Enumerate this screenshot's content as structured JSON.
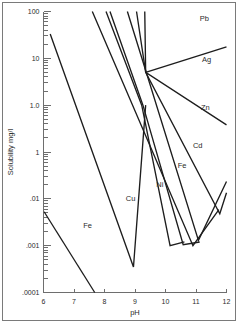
{
  "chart_data": {
    "type": "line",
    "title": "",
    "xlabel": "pH",
    "ylabel": "Solubility mg/l",
    "xlim": [
      6,
      12
    ],
    "ylim": [
      0.0001,
      100
    ],
    "yscale": "log",
    "grid": false,
    "legend_position": "inline-labels",
    "x_ticks": [
      "6",
      "7",
      "8",
      "9",
      "10",
      "11",
      "12"
    ],
    "x_tick_values": [
      6,
      7,
      8,
      9,
      10,
      11,
      12
    ],
    "y_ticks": [
      "100",
      "10",
      "1.0",
      "1",
      ".01",
      ".001",
      ".0001"
    ],
    "y_tick_values": [
      100,
      10,
      1.0,
      0.1,
      0.01,
      0.001,
      0.0001
    ],
    "annotations": [
      {
        "text": "Pb",
        "x": 11.12,
        "y": 62
      },
      {
        "text": "Ag",
        "x": 11.2,
        "y": 8.5
      },
      {
        "text": "Zn",
        "x": 11.16,
        "y": 0.78
      },
      {
        "text": "Cd",
        "x": 10.9,
        "y": 0.12
      },
      {
        "text": "Fe",
        "x": 10.4,
        "y": 0.045
      },
      {
        "text": "Ni",
        "x": 9.7,
        "y": 0.018
      },
      {
        "text": "Cu",
        "x": 8.7,
        "y": 0.0092
      },
      {
        "text": "Fe",
        "x": 7.3,
        "y": 0.0024
      }
    ],
    "series": [
      {
        "name": "Fe",
        "label": "Fe",
        "points": [
          [
            6.02,
            0.0053
          ],
          [
            7.68,
            0.0001
          ]
        ]
      },
      {
        "name": "Cu",
        "label": "Cu",
        "points": [
          [
            6.22,
            33
          ],
          [
            8.95,
            0.00035
          ],
          [
            9.35,
            1.0
          ]
        ]
      },
      {
        "name": "Ni",
        "label": "Ni",
        "points": [
          [
            8.05,
            100
          ],
          [
            9.22,
            1.0
          ],
          [
            10.15,
            0.001
          ],
          [
            10.62,
            0.0012
          ]
        ]
      },
      {
        "name": "Ni2",
        "label": "",
        "points": [
          [
            8.18,
            100
          ],
          [
            9.26,
            1.0
          ],
          [
            10.58,
            0.00105
          ],
          [
            11.12,
            0.0012
          ]
        ]
      },
      {
        "name": "Fe2",
        "label": "Fe",
        "points": [
          [
            7.6,
            100
          ],
          [
            10.9,
            0.001
          ],
          [
            11.75,
            0.0059
          ]
        ]
      },
      {
        "name": "Cd",
        "label": "Cd",
        "points": [
          [
            8.75,
            100
          ],
          [
            11.08,
            0.0013
          ],
          [
            12.0,
            0.0235
          ]
        ]
      },
      {
        "name": "Zn",
        "label": "Zn",
        "points": [
          [
            9.32,
            100
          ],
          [
            9.35,
            5.0
          ],
          [
            11.78,
            0.0048
          ],
          [
            12.0,
            0.0135
          ]
        ]
      },
      {
        "name": "Pb",
        "label": "Pb",
        "points": [
          [
            9.05,
            100
          ],
          [
            9.35,
            5.0
          ],
          [
            12.0,
            0.38
          ]
        ]
      },
      {
        "name": "Ag",
        "label": "Ag",
        "points": [
          [
            9.35,
            5.0
          ],
          [
            12.0,
            17.5
          ]
        ]
      }
    ]
  }
}
